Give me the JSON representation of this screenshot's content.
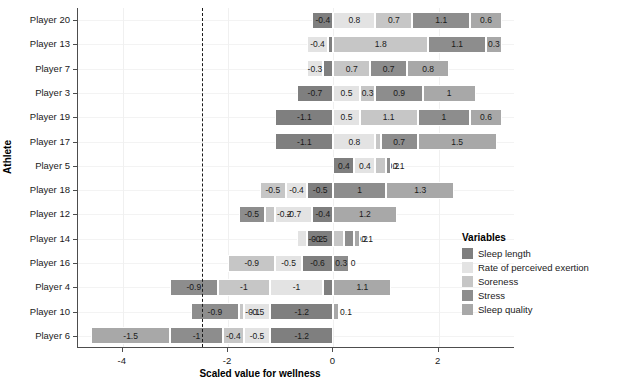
{
  "chart_data": {
    "type": "bar",
    "orientation": "horizontal",
    "stacked": true,
    "title": "",
    "xlabel": "Scaled value for wellness",
    "ylabel": "Athlete",
    "xlim": [
      -4.85,
      3.45
    ],
    "xticks": [
      -4,
      -2,
      0,
      2
    ],
    "xticklabels": [
      "-4",
      "-2",
      "0",
      "2"
    ],
    "grid": true,
    "reference_line": -2.5,
    "legend": {
      "title": "Variables",
      "position": "right",
      "entries": [
        {
          "name": "Sleep length",
          "color": "#7f7f7f"
        },
        {
          "name": "Rate of perceived exertion",
          "color": "#e3e3e3"
        },
        {
          "name": "Soreness",
          "color": "#c6c6c6"
        },
        {
          "name": "Stress",
          "color": "#8d8d8d"
        },
        {
          "name": "Sleep quality",
          "color": "#a8a8a8"
        }
      ]
    },
    "categories": [
      "Player 20",
      "Player 13",
      "Player 7",
      "Player 3",
      "Player 19",
      "Player 17",
      "Player 5",
      "Player 18",
      "Player 12",
      "Player 14",
      "Player 16",
      "Player 4",
      "Player 10",
      "Player 6"
    ],
    "series": [
      {
        "name": "Sleep length",
        "values": [
          -0.4,
          -0.1,
          -0.2,
          -0.7,
          -1.1,
          -1.1,
          0.4,
          -0.5,
          -0.4,
          -0.5,
          -0.6,
          -0.2,
          -1.2,
          -1.2
        ]
      },
      {
        "name": "Rate of perceived exertion",
        "values": [
          0.8,
          -0.4,
          -0.3,
          0.5,
          0.5,
          0.8,
          0.4,
          -0.4,
          -0.7,
          -0.2,
          -0.5,
          -1.0,
          -0.5,
          -0.5
        ]
      },
      {
        "name": "Soreness",
        "values": [
          0.7,
          1.8,
          0.7,
          0.3,
          1.1,
          0.1,
          0.2,
          -0.5,
          -0.2,
          0.2,
          -0.9,
          -1.0,
          -0.1,
          -0.4
        ]
      },
      {
        "name": "Stress",
        "values": [
          1.1,
          1.1,
          0.7,
          0.9,
          1.0,
          0.7,
          0.1,
          1.0,
          -0.5,
          0.2,
          0.3,
          -0.9,
          -0.9,
          -1.0
        ]
      },
      {
        "name": "Sleep quality",
        "values": [
          0.6,
          0.3,
          0.8,
          1.0,
          0.6,
          1.5,
          0.0,
          1.3,
          1.2,
          0.1,
          0.0,
          1.1,
          0.1,
          -1.5
        ]
      }
    ],
    "labels": [
      [
        "-0.4",
        "0.8",
        "0.7",
        "1.1",
        "0.6"
      ],
      [
        "-0.1",
        "-0.4",
        "1.8",
        "1.1",
        "0.3"
      ],
      [
        "-0.2",
        "-0.3",
        "0.7",
        "0.7",
        "0.8"
      ],
      [
        "-0.7",
        "0.5",
        "0.3",
        "0.9",
        "1"
      ],
      [
        "-1.1",
        "0.5",
        "1.1",
        "1",
        "0.6"
      ],
      [
        "-1.1",
        "0.8",
        "0.1",
        "0.7",
        "1.5"
      ],
      [
        "0.4",
        "0.4",
        "0.2",
        "0.1",
        ""
      ],
      [
        "-0.5",
        "-0.4",
        "-0.5",
        "1",
        "1.3"
      ],
      [
        "-0.4",
        "-0.7",
        "-0.2",
        "-0.5",
        "1.2"
      ],
      [
        "-0.5",
        "-0.2",
        "0.2",
        "0.2",
        "0.1"
      ],
      [
        "-0.6",
        "-0.5",
        "-0.9",
        "0.3",
        "0"
      ],
      [
        "-0.2",
        "-1",
        "-1",
        "-0.9",
        "1.1"
      ],
      [
        "-1.2",
        "-0.5",
        "-0.1",
        "-0.9",
        "0.1"
      ],
      [
        "-1.2",
        "-0.5",
        "-0.4",
        "-1",
        "-1.5"
      ]
    ]
  },
  "caption": {
    "text": ""
  }
}
